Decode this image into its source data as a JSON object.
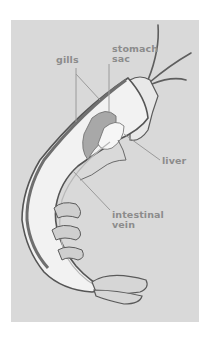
{
  "diagram": {
    "labels": [
      {
        "id": "gills",
        "text": "gills"
      },
      {
        "id": "stomach-sac",
        "line1": "stomach",
        "line2": "sac"
      },
      {
        "id": "liver",
        "text": "liver"
      },
      {
        "id": "intestinal-vein",
        "line1": "intestinal",
        "line2": "vein"
      }
    ],
    "colors": {
      "background": "#ffffff",
      "panel": "#d9d9d9",
      "label_text": "#8c8c8c",
      "leader_line": "#9a9a9a",
      "shell_outline": "#5a5a5a",
      "flesh_light": "#f2f2f2",
      "organ_mid": "#a8a8a8"
    }
  }
}
